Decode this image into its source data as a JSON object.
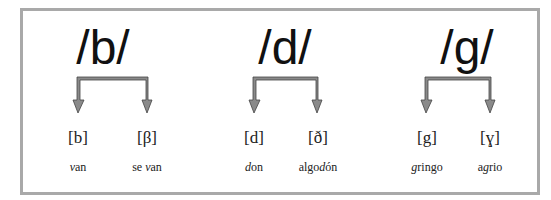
{
  "diagram": {
    "groups": [
      {
        "phoneme": "/b/",
        "allophones": [
          {
            "symbol": "[b]",
            "example_parts": [
              {
                "text": "v",
                "italic": true
              },
              {
                "text": "an",
                "italic": false
              }
            ],
            "example": "van"
          },
          {
            "symbol": "[β]",
            "example_parts": [
              {
                "text": "se ",
                "italic": false
              },
              {
                "text": "v",
                "italic": true
              },
              {
                "text": "an",
                "italic": false
              }
            ],
            "example": "se van"
          }
        ]
      },
      {
        "phoneme": "/d/",
        "allophones": [
          {
            "symbol": "[d]",
            "example_parts": [
              {
                "text": "d",
                "italic": true
              },
              {
                "text": "on",
                "italic": false
              }
            ],
            "example": "don"
          },
          {
            "symbol": "[ð]",
            "example_parts": [
              {
                "text": "algo",
                "italic": false
              },
              {
                "text": "d",
                "italic": true
              },
              {
                "text": "ón",
                "italic": false
              }
            ],
            "example": "algodón"
          }
        ]
      },
      {
        "phoneme": "/g/",
        "allophones": [
          {
            "symbol": "[g]",
            "example_parts": [
              {
                "text": "g",
                "italic": true
              },
              {
                "text": "ringo",
                "italic": false
              }
            ],
            "example": "gringo"
          },
          {
            "symbol": "[ɣ]",
            "example_parts": [
              {
                "text": "a",
                "italic": false
              },
              {
                "text": "g",
                "italic": true
              },
              {
                "text": "rio",
                "italic": false
              }
            ],
            "example": "agrio"
          }
        ]
      }
    ]
  },
  "colors": {
    "frame_border": "#a9a9a9",
    "arrow_fill": "#8a8a8a",
    "arrow_stroke": "#444444",
    "text": "#1a1a1a"
  }
}
